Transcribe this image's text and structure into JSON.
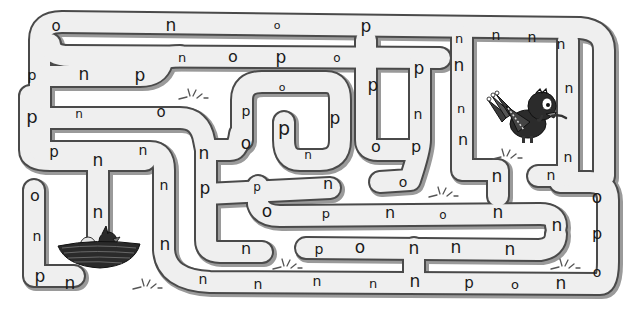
{
  "puzzle": {
    "type": "letter-maze",
    "start": "bird",
    "goal": "nest",
    "target_letter": "n"
  },
  "letters": [
    {
      "ch": "o",
      "x": 56,
      "y": 26,
      "s": 15
    },
    {
      "ch": "n",
      "x": 171,
      "y": 25,
      "s": 17
    },
    {
      "ch": "o",
      "x": 277,
      "y": 25,
      "s": 11
    },
    {
      "ch": "p",
      "x": 366,
      "y": 26,
      "s": 17
    },
    {
      "ch": "n",
      "x": 459,
      "y": 38,
      "s": 13
    },
    {
      "ch": "n",
      "x": 496,
      "y": 35,
      "s": 14
    },
    {
      "ch": "n",
      "x": 532,
      "y": 37,
      "s": 14
    },
    {
      "ch": "n",
      "x": 561,
      "y": 44,
      "s": 14
    },
    {
      "ch": "n",
      "x": 182,
      "y": 57,
      "s": 13
    },
    {
      "ch": "o",
      "x": 233,
      "y": 57,
      "s": 16
    },
    {
      "ch": "p",
      "x": 281,
      "y": 57,
      "s": 17
    },
    {
      "ch": "o",
      "x": 337,
      "y": 58,
      "s": 12
    },
    {
      "ch": "p",
      "x": 419,
      "y": 68,
      "s": 17
    },
    {
      "ch": "n",
      "x": 459,
      "y": 65,
      "s": 17
    },
    {
      "ch": "p",
      "x": 32,
      "y": 75,
      "s": 14
    },
    {
      "ch": "n",
      "x": 84,
      "y": 74,
      "s": 17
    },
    {
      "ch": "p",
      "x": 140,
      "y": 75,
      "s": 17
    },
    {
      "ch": "o",
      "x": 282,
      "y": 87,
      "s": 11
    },
    {
      "ch": "p",
      "x": 373,
      "y": 85,
      "s": 17
    },
    {
      "ch": "n",
      "x": 569,
      "y": 88,
      "s": 14
    },
    {
      "ch": "p",
      "x": 32,
      "y": 117,
      "s": 18
    },
    {
      "ch": "n",
      "x": 79,
      "y": 114,
      "s": 12
    },
    {
      "ch": "o",
      "x": 161,
      "y": 112,
      "s": 15
    },
    {
      "ch": "p",
      "x": 246,
      "y": 111,
      "s": 14
    },
    {
      "ch": "p",
      "x": 284,
      "y": 128,
      "s": 19
    },
    {
      "ch": "p",
      "x": 335,
      "y": 118,
      "s": 17
    },
    {
      "ch": "n",
      "x": 418,
      "y": 114,
      "s": 14
    },
    {
      "ch": "n",
      "x": 461,
      "y": 108,
      "s": 13
    },
    {
      "ch": "n",
      "x": 463,
      "y": 140,
      "s": 16
    },
    {
      "ch": "o",
      "x": 246,
      "y": 143,
      "s": 17
    },
    {
      "ch": "n",
      "x": 308,
      "y": 155,
      "s": 12
    },
    {
      "ch": "o",
      "x": 376,
      "y": 147,
      "s": 16
    },
    {
      "ch": "p",
      "x": 416,
      "y": 147,
      "s": 16
    },
    {
      "ch": "p",
      "x": 54,
      "y": 152,
      "s": 15
    },
    {
      "ch": "n",
      "x": 98,
      "y": 160,
      "s": 17
    },
    {
      "ch": "n",
      "x": 143,
      "y": 150,
      "s": 14
    },
    {
      "ch": "n",
      "x": 204,
      "y": 153,
      "s": 17
    },
    {
      "ch": "n",
      "x": 568,
      "y": 157,
      "s": 14
    },
    {
      "ch": "n",
      "x": 164,
      "y": 185,
      "s": 14
    },
    {
      "ch": "p",
      "x": 205,
      "y": 188,
      "s": 17
    },
    {
      "ch": "p",
      "x": 257,
      "y": 187,
      "s": 12
    },
    {
      "ch": "n",
      "x": 328,
      "y": 184,
      "s": 16
    },
    {
      "ch": "o",
      "x": 403,
      "y": 182,
      "s": 14
    },
    {
      "ch": "n",
      "x": 497,
      "y": 176,
      "s": 17
    },
    {
      "ch": "n",
      "x": 551,
      "y": 175,
      "s": 14
    },
    {
      "ch": "o",
      "x": 35,
      "y": 196,
      "s": 16
    },
    {
      "ch": "o",
      "x": 267,
      "y": 211,
      "s": 17
    },
    {
      "ch": "p",
      "x": 326,
      "y": 213,
      "s": 13
    },
    {
      "ch": "n",
      "x": 390,
      "y": 213,
      "s": 16
    },
    {
      "ch": "o",
      "x": 443,
      "y": 215,
      "s": 12
    },
    {
      "ch": "n",
      "x": 498,
      "y": 212,
      "s": 17
    },
    {
      "ch": "o",
      "x": 597,
      "y": 197,
      "s": 17
    },
    {
      "ch": "n",
      "x": 98,
      "y": 212,
      "s": 17
    },
    {
      "ch": "n",
      "x": 557,
      "y": 225,
      "s": 17
    },
    {
      "ch": "n",
      "x": 37,
      "y": 236,
      "s": 14
    },
    {
      "ch": "n",
      "x": 165,
      "y": 244,
      "s": 17
    },
    {
      "ch": "n",
      "x": 246,
      "y": 249,
      "s": 16
    },
    {
      "ch": "p",
      "x": 319,
      "y": 249,
      "s": 14
    },
    {
      "ch": "o",
      "x": 360,
      "y": 247,
      "s": 17
    },
    {
      "ch": "n",
      "x": 414,
      "y": 248,
      "s": 17
    },
    {
      "ch": "n",
      "x": 456,
      "y": 247,
      "s": 17
    },
    {
      "ch": "n",
      "x": 510,
      "y": 249,
      "s": 17
    },
    {
      "ch": "p",
      "x": 597,
      "y": 234,
      "s": 16
    },
    {
      "ch": "p",
      "x": 40,
      "y": 276,
      "s": 17
    },
    {
      "ch": "n",
      "x": 70,
      "y": 283,
      "s": 17
    },
    {
      "ch": "n",
      "x": 203,
      "y": 279,
      "s": 14
    },
    {
      "ch": "n",
      "x": 258,
      "y": 284,
      "s": 14
    },
    {
      "ch": "n",
      "x": 317,
      "y": 281,
      "s": 14
    },
    {
      "ch": "n",
      "x": 373,
      "y": 283,
      "s": 13
    },
    {
      "ch": "n",
      "x": 415,
      "y": 281,
      "s": 17
    },
    {
      "ch": "p",
      "x": 469,
      "y": 283,
      "s": 15
    },
    {
      "ch": "o",
      "x": 515,
      "y": 284,
      "s": 13
    },
    {
      "ch": "n",
      "x": 561,
      "y": 283,
      "s": 17
    },
    {
      "ch": "o",
      "x": 597,
      "y": 272,
      "s": 14
    }
  ],
  "characters": {
    "bird": {
      "label": "bird",
      "color": "#2b2b2b"
    },
    "nest": {
      "label": "nest with chick and egg",
      "color": "#2a2a2a"
    }
  },
  "colors": {
    "path_fill": "#efefef",
    "path_border": "#4a4a4a",
    "shadow": "#9a9a9a",
    "text": "#1a1a1a",
    "background": "#ffffff"
  }
}
